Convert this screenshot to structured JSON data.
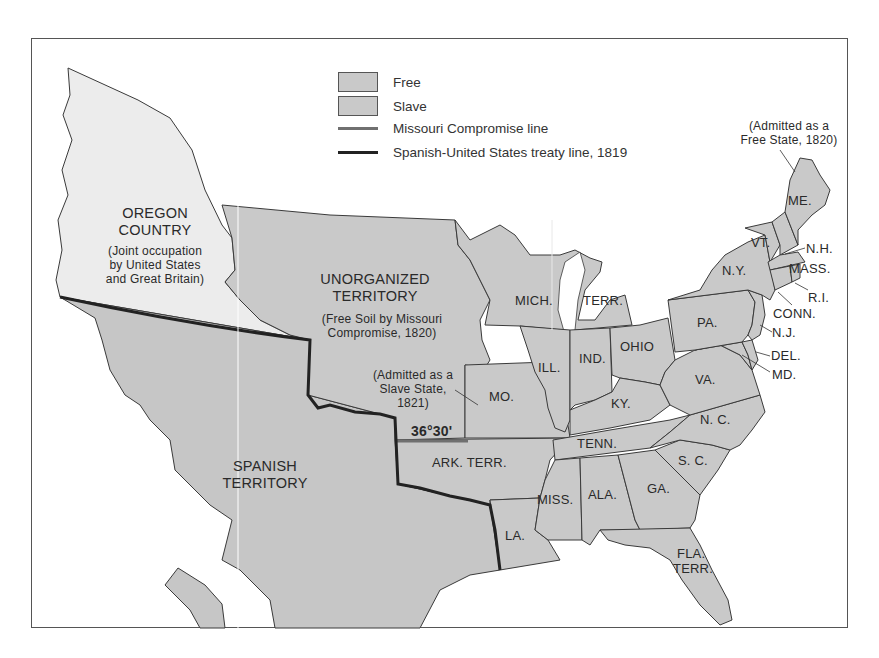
{
  "map": {
    "title": "",
    "colors": {
      "background": "#ffffff",
      "free": "#c9c9c9",
      "slave": "#c9c9c9",
      "oregon_joint": "#ececec",
      "spanish": "#c6c6c6",
      "state_border": "#3a3a3a",
      "missouri_compromise_line": "#707070",
      "treaty_line": "#222222"
    },
    "legend": {
      "items": [
        {
          "type": "swatch",
          "label": "Free"
        },
        {
          "type": "swatch",
          "label": "Slave"
        },
        {
          "type": "line",
          "label": "Missouri Compromise line"
        },
        {
          "type": "line",
          "label": "Spanish-United States treaty  line, 1819"
        }
      ]
    },
    "regions": {
      "oregon": {
        "name_line1": "OREGON",
        "name_line2": "COUNTRY",
        "note_line1": "(Joint occupation",
        "note_line2": "by United States",
        "note_line3": "and Great Britain)"
      },
      "unorganized": {
        "name_line1": "UNORGANIZED",
        "name_line2": "TERRITORY",
        "note_line1": "(Free Soil by Missouri",
        "note_line2": "Compromise, 1820)"
      },
      "spanish": {
        "name_line1": "SPANISH",
        "name_line2": "TERRITORY"
      }
    },
    "annotations": {
      "missouri": {
        "line1": "(Admitted as a",
        "line2": "Slave State,",
        "line3": "1821)"
      },
      "maine": {
        "line1": "(Admitted as a",
        "line2": "Free State, 1820)"
      },
      "latitude": "36°30'"
    },
    "states": {
      "me": "ME.",
      "vt": "VT.",
      "nh": "N.H.",
      "mass": "MASS.",
      "ri": "R.I.",
      "conn": "CONN.",
      "ny": "N.Y.",
      "nj": "N.J.",
      "pa": "PA.",
      "del": "DEL.",
      "md": "MD.",
      "va": "VA.",
      "nc": "N. C.",
      "sc": "S. C.",
      "ga": "GA.",
      "fla_1": "FLA.",
      "fla_2": "TERR.",
      "ala": "ALA.",
      "miss": "MISS.",
      "la": "LA.",
      "tenn": "TENN.",
      "ky": "KY.",
      "ohio": "OHIO",
      "ind": "IND.",
      "ill": "ILL.",
      "mo": "MO.",
      "ark": "ARK. TERR.",
      "mich_1": "MICH.",
      "mich_2": "TERR."
    }
  }
}
